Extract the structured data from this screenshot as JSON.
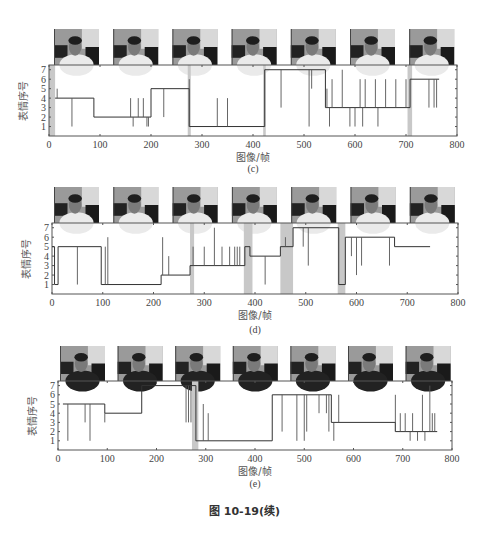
{
  "figure_caption": "图 10-19(续)",
  "chart_data": [
    {
      "id": "c",
      "type": "line",
      "subtitle": "(c)",
      "xlabel": "图像/帧",
      "ylabel": "表情序号",
      "xlim": [
        0,
        800
      ],
      "ylim": [
        0,
        7.5
      ],
      "xticks": [
        0,
        100,
        200,
        300,
        400,
        500,
        600,
        700,
        800
      ],
      "yticks": [
        1,
        2,
        3,
        4,
        5,
        6,
        7
      ],
      "thumbnails": 7,
      "shaded_regions": [
        [
          0,
          12
        ],
        [
          272,
          278
        ],
        [
          420,
          425
        ],
        [
          703,
          712
        ]
      ],
      "steps": [
        [
          12,
          4
        ],
        [
          88,
          2
        ],
        [
          200,
          5
        ],
        [
          275,
          1
        ],
        [
          423,
          7
        ],
        [
          542,
          3
        ],
        [
          708,
          6
        ],
        [
          765,
          null
        ]
      ],
      "spikes": [
        [
          16,
          5
        ],
        [
          45,
          1
        ],
        [
          160,
          4
        ],
        [
          165,
          1
        ],
        [
          175,
          4
        ],
        [
          185,
          4
        ],
        [
          192,
          1
        ],
        [
          195,
          1
        ],
        [
          225,
          2
        ],
        [
          275,
          6
        ],
        [
          330,
          4
        ],
        [
          350,
          4
        ],
        [
          455,
          3
        ],
        [
          510,
          1
        ],
        [
          515,
          5
        ],
        [
          545,
          5
        ],
        [
          550,
          1
        ],
        [
          555,
          6
        ],
        [
          575,
          7
        ],
        [
          590,
          1
        ],
        [
          600,
          1
        ],
        [
          610,
          6
        ],
        [
          615,
          1
        ],
        [
          620,
          6
        ],
        [
          640,
          6
        ],
        [
          645,
          1
        ],
        [
          660,
          6
        ],
        [
          680,
          6
        ],
        [
          700,
          6
        ],
        [
          745,
          3
        ],
        [
          755,
          3
        ],
        [
          760,
          3
        ]
      ]
    },
    {
      "id": "d",
      "type": "line",
      "subtitle": "(d)",
      "xlabel": "图像/帧",
      "ylabel": "表情序号",
      "xlim": [
        0,
        800
      ],
      "ylim": [
        0,
        7.5
      ],
      "xticks": [
        0,
        100,
        200,
        300,
        400,
        500,
        600,
        700,
        800
      ],
      "yticks": [
        1,
        2,
        3,
        4,
        5,
        6,
        7
      ],
      "thumbnails": 7,
      "shaded_regions": [
        [
          272,
          280
        ],
        [
          378,
          395
        ],
        [
          450,
          475
        ],
        [
          563,
          578
        ]
      ],
      "steps": [
        [
          0,
          5
        ],
        [
          5,
          1
        ],
        [
          12,
          5
        ],
        [
          97,
          1
        ],
        [
          215,
          2
        ],
        [
          272,
          3
        ],
        [
          380,
          5
        ],
        [
          390,
          4
        ],
        [
          450,
          5
        ],
        [
          475,
          7
        ],
        [
          565,
          1
        ],
        [
          578,
          6
        ],
        [
          675,
          5
        ],
        [
          745,
          null
        ]
      ],
      "spikes": [
        [
          50,
          1
        ],
        [
          105,
          5
        ],
        [
          110,
          6
        ],
        [
          218,
          6
        ],
        [
          230,
          4
        ],
        [
          278,
          5
        ],
        [
          300,
          5
        ],
        [
          320,
          7
        ],
        [
          335,
          5
        ],
        [
          350,
          5
        ],
        [
          360,
          5
        ],
        [
          365,
          5
        ],
        [
          370,
          5
        ],
        [
          420,
          1
        ],
        [
          460,
          6
        ],
        [
          495,
          5
        ],
        [
          505,
          3
        ],
        [
          590,
          4
        ],
        [
          600,
          2
        ],
        [
          610,
          3
        ],
        [
          665,
          3
        ]
      ]
    },
    {
      "id": "e",
      "type": "line",
      "subtitle": "(e)",
      "xlabel": "图像/帧",
      "ylabel": "表情序号",
      "xlim": [
        0,
        800
      ],
      "ylim": [
        0,
        7.5
      ],
      "xticks": [
        0,
        100,
        200,
        300,
        400,
        500,
        600,
        700,
        800
      ],
      "yticks": [
        1,
        2,
        3,
        4,
        5,
        6,
        7
      ],
      "thumbnails": 7,
      "shaded_regions": [
        [
          272,
          285
        ]
      ],
      "steps": [
        [
          10,
          5
        ],
        [
          95,
          4
        ],
        [
          170,
          7
        ],
        [
          280,
          1
        ],
        [
          435,
          6
        ],
        [
          555,
          3
        ],
        [
          685,
          2
        ],
        [
          770,
          null
        ]
      ],
      "spikes": [
        [
          20,
          1
        ],
        [
          55,
          3
        ],
        [
          65,
          1
        ],
        [
          95,
          3
        ],
        [
          260,
          3
        ],
        [
          265,
          3
        ],
        [
          270,
          3
        ],
        [
          295,
          5
        ],
        [
          300,
          1
        ],
        [
          305,
          4
        ],
        [
          455,
          2
        ],
        [
          485,
          1
        ],
        [
          500,
          1
        ],
        [
          505,
          2
        ],
        [
          530,
          4
        ],
        [
          545,
          4
        ],
        [
          550,
          2
        ],
        [
          560,
          1
        ],
        [
          570,
          6
        ],
        [
          685,
          6
        ],
        [
          695,
          4
        ],
        [
          705,
          4
        ],
        [
          715,
          1
        ],
        [
          720,
          4
        ],
        [
          730,
          1
        ],
        [
          740,
          6
        ],
        [
          745,
          1
        ],
        [
          755,
          7
        ],
        [
          760,
          4
        ],
        [
          765,
          4
        ]
      ]
    }
  ]
}
